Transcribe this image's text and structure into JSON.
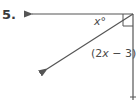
{
  "problem": {
    "number": "5.",
    "labels": {
      "angle_top": {
        "var": "x",
        "suffix": "°"
      },
      "angle_bottom": {
        "open": "(2",
        "var": "x",
        "rest": " − 3)°"
      }
    },
    "colors": {
      "line": "#555555",
      "text": "#4a4a4a"
    },
    "elements": [
      "horizontal-ray",
      "vertical-ray",
      "diagonal-ray",
      "right-angle-marker"
    ]
  }
}
